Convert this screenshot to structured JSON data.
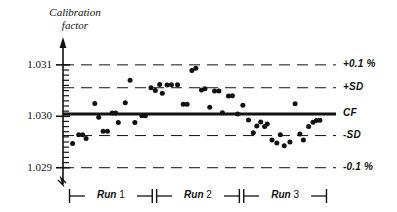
{
  "chart_data": {
    "type": "scatter",
    "title": "",
    "xlabel": "",
    "ylabel": "Calibration factor",
    "ylim": [
      1.0288,
      1.03125
    ],
    "xlim": [
      0,
      62
    ],
    "grid": false,
    "legend": "none",
    "y_ticks": [
      {
        "value": 1.031,
        "label": "1.031"
      },
      {
        "value": 1.03,
        "label": "1.030"
      },
      {
        "value": 1.029,
        "label": "1.029"
      }
    ],
    "y_minor_tick_step": 0.0001,
    "reference_lines": [
      {
        "name": "plus-tolerance",
        "label": "+0.1 %",
        "value": 1.031,
        "style": "dashed",
        "weight": 1
      },
      {
        "name": "plus-sd",
        "label": "+SD",
        "value": 1.030555,
        "style": "dashed",
        "weight": 1
      },
      {
        "name": "cf",
        "label": "CF",
        "value": 1.030045,
        "style": "solid",
        "weight": 3
      },
      {
        "name": "minus-sd",
        "label": "-SD",
        "value": 1.029625,
        "style": "dashed",
        "weight": 1
      },
      {
        "name": "minus-tolerance",
        "label": "-0.1 %",
        "value": 1.029,
        "style": "dashed",
        "weight": 1
      }
    ],
    "groups": [
      {
        "name": "run-1",
        "label_word": "Run",
        "label_num": "1",
        "x_start": 1.5,
        "x_end": 20.5
      },
      {
        "name": "run-2",
        "label_word": "Run",
        "label_num": "2",
        "x_start": 21.5,
        "x_end": 40.5
      },
      {
        "name": "run-3",
        "label_word": "Run",
        "label_num": "3",
        "x_start": 41.5,
        "x_end": 60.5
      }
    ],
    "series": [
      {
        "name": "calibration-measurements",
        "marker": "filled-circle",
        "color": "#111111",
        "points": [
          {
            "x": 2.2,
            "y": 1.02947,
            "run": 1
          },
          {
            "x": 3.6,
            "y": 1.02964,
            "run": 1
          },
          {
            "x": 4.5,
            "y": 1.02964,
            "run": 1
          },
          {
            "x": 5.3,
            "y": 1.02957,
            "run": 1
          },
          {
            "x": 7.3,
            "y": 1.03025,
            "run": 1
          },
          {
            "x": 8.2,
            "y": 1.02998,
            "run": 1
          },
          {
            "x": 9.2,
            "y": 1.02971,
            "run": 1
          },
          {
            "x": 10.2,
            "y": 1.02971,
            "run": 1
          },
          {
            "x": 11.3,
            "y": 1.030065,
            "run": 1
          },
          {
            "x": 12.1,
            "y": 1.030065,
            "run": 1
          },
          {
            "x": 12.7,
            "y": 1.02988,
            "run": 1
          },
          {
            "x": 14.3,
            "y": 1.030265,
            "run": 1
          },
          {
            "x": 15.4,
            "y": 1.0307,
            "run": 1
          },
          {
            "x": 16.5,
            "y": 1.02988,
            "run": 1
          },
          {
            "x": 18.1,
            "y": 1.03001,
            "run": 1
          },
          {
            "x": 18.9,
            "y": 1.03001,
            "run": 1
          },
          {
            "x": 20.2,
            "y": 1.030555,
            "run": 1
          },
          {
            "x": 21.2,
            "y": 1.0305,
            "run": 2
          },
          {
            "x": 22.2,
            "y": 1.03062,
            "run": 2
          },
          {
            "x": 22.8,
            "y": 1.03045,
            "run": 2
          },
          {
            "x": 23.9,
            "y": 1.03061,
            "run": 2
          },
          {
            "x": 24.9,
            "y": 1.030615,
            "run": 2
          },
          {
            "x": 26.3,
            "y": 1.030615,
            "run": 2
          },
          {
            "x": 27.6,
            "y": 1.030235,
            "run": 2
          },
          {
            "x": 28.5,
            "y": 1.030235,
            "run": 2
          },
          {
            "x": 29.6,
            "y": 1.03089,
            "run": 2
          },
          {
            "x": 30.5,
            "y": 1.030935,
            "run": 2
          },
          {
            "x": 31.8,
            "y": 1.03051,
            "run": 2
          },
          {
            "x": 32.6,
            "y": 1.030535,
            "run": 2
          },
          {
            "x": 33.7,
            "y": 1.030175,
            "run": 2
          },
          {
            "x": 34.8,
            "y": 1.03049,
            "run": 2
          },
          {
            "x": 35.8,
            "y": 1.03049,
            "run": 2
          },
          {
            "x": 36.6,
            "y": 1.03007,
            "run": 2
          },
          {
            "x": 38.0,
            "y": 1.030395,
            "run": 2
          },
          {
            "x": 38.9,
            "y": 1.0304,
            "run": 2
          },
          {
            "x": 40.1,
            "y": 1.030045,
            "run": 2
          },
          {
            "x": 41.3,
            "y": 1.030215,
            "run": 3
          },
          {
            "x": 42.6,
            "y": 1.02993,
            "run": 3
          },
          {
            "x": 43.7,
            "y": 1.02968,
            "run": 3
          },
          {
            "x": 44.5,
            "y": 1.02981,
            "run": 3
          },
          {
            "x": 45.4,
            "y": 1.02989,
            "run": 3
          },
          {
            "x": 46.3,
            "y": 1.0298,
            "run": 3
          },
          {
            "x": 46.9,
            "y": 1.02985,
            "run": 3
          },
          {
            "x": 48.0,
            "y": 1.02954,
            "run": 3
          },
          {
            "x": 49.1,
            "y": 1.02948,
            "run": 3
          },
          {
            "x": 49.9,
            "y": 1.02964,
            "run": 3
          },
          {
            "x": 50.8,
            "y": 1.029425,
            "run": 3
          },
          {
            "x": 52.1,
            "y": 1.0295,
            "run": 3
          },
          {
            "x": 53.3,
            "y": 1.030245,
            "run": 3
          },
          {
            "x": 54.4,
            "y": 1.029655,
            "run": 3
          },
          {
            "x": 55.2,
            "y": 1.02954,
            "run": 3
          },
          {
            "x": 56.4,
            "y": 1.0298,
            "run": 3
          },
          {
            "x": 57.4,
            "y": 1.029885,
            "run": 3
          },
          {
            "x": 58.2,
            "y": 1.02992,
            "run": 3
          },
          {
            "x": 59.0,
            "y": 1.029925,
            "run": 3
          }
        ]
      }
    ]
  },
  "axis": {
    "ylabel_line1": "Calibration",
    "ylabel_line2": "factor"
  }
}
